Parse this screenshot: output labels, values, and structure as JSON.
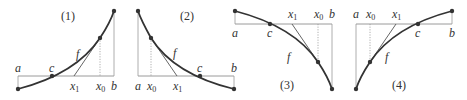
{
  "figure": {
    "panels": [
      {
        "id": "1",
        "label": "(1)",
        "labels": {
          "a": "a",
          "b": "b",
          "c": "c",
          "f": "f",
          "x0": "x",
          "x0_sub": "0",
          "x1": "x",
          "x1_sub": "1"
        }
      },
      {
        "id": "2",
        "label": "(2)",
        "labels": {
          "a": "a",
          "b": "b",
          "c": "c",
          "f": "f",
          "x0": "x",
          "x0_sub": "0",
          "x1": "x",
          "x1_sub": "1"
        }
      },
      {
        "id": "3",
        "label": "(3)",
        "labels": {
          "a": "a",
          "b": "b",
          "c": "c",
          "f": "f",
          "x0": "x",
          "x0_sub": "0",
          "x1": "x",
          "x1_sub": "1"
        }
      },
      {
        "id": "4",
        "label": "(4)",
        "labels": {
          "a": "a",
          "b": "b",
          "c": "c",
          "f": "f",
          "x0": "x",
          "x0_sub": "0",
          "x1": "x",
          "x1_sub": "1"
        }
      }
    ]
  }
}
